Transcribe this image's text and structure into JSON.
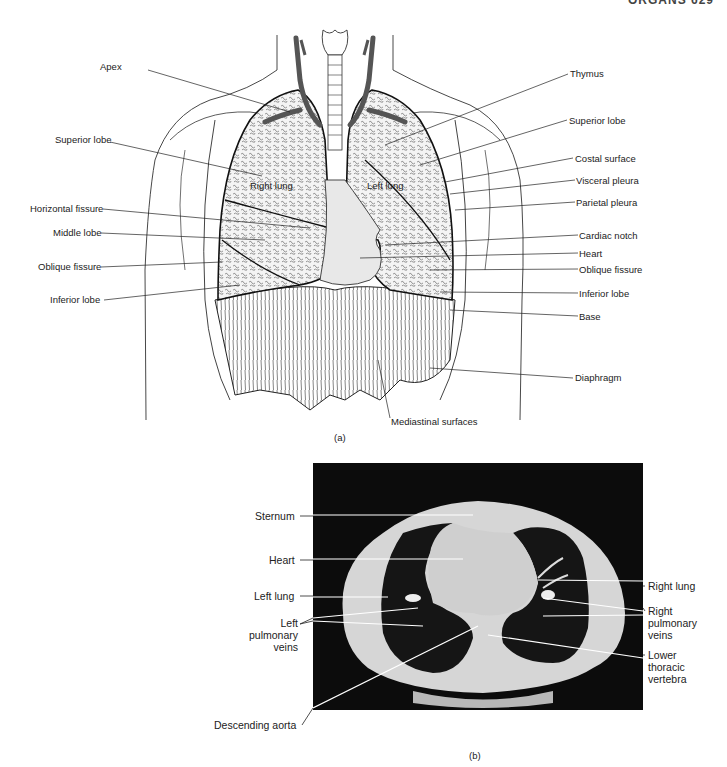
{
  "header": {
    "text": "ORGANS 629"
  },
  "figure_a": {
    "caption": "(a)",
    "inner_labels": {
      "right_lung": "Right lung",
      "left_lung": "Left lung"
    },
    "left_labels": [
      {
        "text": "Apex",
        "x": 100,
        "y": 67
      },
      {
        "text": "Superior lobe",
        "x": 55,
        "y": 138
      },
      {
        "text": "Horizontal fissure",
        "x": 30,
        "y": 205
      },
      {
        "text": "Middle lobe",
        "x": 53,
        "y": 229
      },
      {
        "text": "Oblique fissure",
        "x": 38,
        "y": 263
      },
      {
        "text": "Inferior lobe",
        "x": 50,
        "y": 297
      }
    ],
    "right_labels": [
      {
        "text": "Thymus",
        "x": 570,
        "y": 70
      },
      {
        "text": "Superior lobe",
        "x": 569,
        "y": 116
      },
      {
        "text": "Costal surface",
        "x": 575,
        "y": 154
      },
      {
        "text": "Visceral pleura",
        "x": 576,
        "y": 176
      },
      {
        "text": "Parietal pleura",
        "x": 576,
        "y": 198
      },
      {
        "text": "Cardiac notch",
        "x": 579,
        "y": 231
      },
      {
        "text": "Heart",
        "x": 579,
        "y": 249
      },
      {
        "text": "Oblique fissure",
        "x": 579,
        "y": 265
      },
      {
        "text": "Inferior lobe",
        "x": 579,
        "y": 290
      },
      {
        "text": "Base",
        "x": 579,
        "y": 313
      },
      {
        "text": "Diaphragm",
        "x": 575,
        "y": 372
      }
    ],
    "bottom_label": {
      "text": "Mediastinal surfaces"
    }
  },
  "figure_b": {
    "caption": "(b)",
    "left_labels": {
      "sternum": "Sternum",
      "heart": "Heart",
      "left_lung": "Left lung",
      "left_pulmonary_veins": [
        "Left",
        "pulmonary",
        "veins"
      ],
      "descending_aorta": "Descending aorta"
    },
    "right_labels": {
      "right_lung": "Right lung",
      "right_pulmonary_veins": [
        "Right",
        "pulmonary",
        "veins"
      ],
      "lower_thoracic_vertebra": [
        "Lower",
        "thoracic",
        "vertebra"
      ]
    }
  }
}
